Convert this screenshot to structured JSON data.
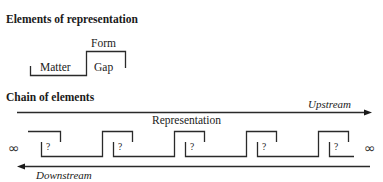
{
  "section1": {
    "title": "Elements of representation",
    "form_label": "Form",
    "matter_label": "Matter",
    "gap_label": "Gap"
  },
  "section2": {
    "title": "Chain of elements",
    "upstream_label": "Upstream",
    "downstream_label": "Downstream",
    "representation_label": "Representation",
    "infinity_left": "∞",
    "infinity_right": "∞",
    "unknown_marks": [
      "?",
      "?",
      "?",
      "?",
      "?"
    ]
  },
  "colors": {
    "line": "#2a2a2a",
    "text": "#1a1a1a"
  }
}
